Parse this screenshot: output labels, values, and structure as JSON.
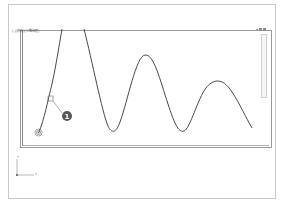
{
  "viewport": {
    "label": "[-][俯视][二维线框]",
    "view": "top",
    "visual_style": "2D wireframe"
  },
  "drawing": {
    "entity": "spline",
    "stroke_color": "#4a4a4a",
    "start_point_marker": "concentric-circle snap marker",
    "grip_square": "selection grip"
  },
  "callout": {
    "number": "1",
    "badge_color": "#555555"
  },
  "ucs": {
    "x_label": "X",
    "y_label": "Y"
  },
  "navigation_bar": {
    "controls": [
      "-",
      "□",
      "□"
    ]
  }
}
